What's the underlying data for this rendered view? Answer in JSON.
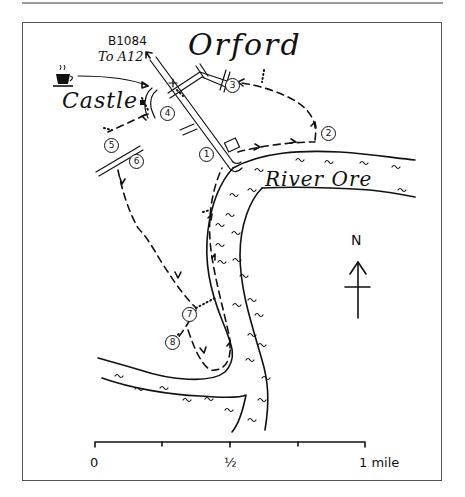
{
  "map": {
    "title": "Orford",
    "labels": {
      "castle": "Castle",
      "river": "River Ore",
      "road_number": "B1084",
      "road_destination": "To A12",
      "north": "N"
    },
    "icons": {
      "cafe": "coffee-cup-icon",
      "north_arrow": "north-arrow-icon",
      "parking": "car-park-icon"
    },
    "waypoints": [
      {
        "n": "1",
        "x": 204,
        "y": 153
      },
      {
        "n": "2",
        "x": 320,
        "y": 128
      },
      {
        "n": "3",
        "x": 223,
        "y": 82
      },
      {
        "n": "4",
        "x": 160,
        "y": 108
      },
      {
        "n": "5",
        "x": 106,
        "y": 136
      },
      {
        "n": "6",
        "x": 132,
        "y": 154
      },
      {
        "n": "7",
        "x": 183,
        "y": 307
      },
      {
        "n": "8",
        "x": 166,
        "y": 337
      }
    ],
    "scale": {
      "ticks": [
        "0",
        "½",
        "1 mile"
      ]
    }
  }
}
